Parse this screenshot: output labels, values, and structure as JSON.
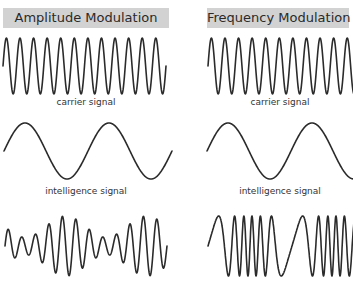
{
  "panels": [
    {
      "title": "Amplitude Modulation",
      "carrier_label": "carrier signal",
      "intelligence_label": "intelligence signal",
      "modulation": "am"
    },
    {
      "title": "Frequency Modulation",
      "carrier_label": "carrier signal",
      "intelligence_label": "intelligence signal",
      "modulation": "fm"
    }
  ],
  "colors": {
    "header_bg": "#d2d2d2",
    "stroke": "#2b2b2b",
    "background": "#ffffff"
  },
  "waves": {
    "carrier_cycles": 12,
    "intelligence_cycles": 2,
    "am_depth": 0.55,
    "fm_deviation": 0.75
  }
}
